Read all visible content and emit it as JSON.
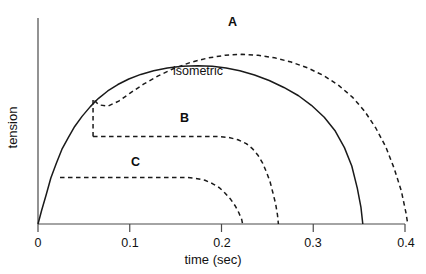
{
  "chart_data": {
    "type": "line",
    "title": "",
    "xlabel": "time (sec)",
    "ylabel": "tension",
    "xlim": [
      0,
      0.4
    ],
    "ylim": [
      0,
      1
    ],
    "xticks": [
      0,
      0.1,
      0.2,
      0.3,
      0.4
    ],
    "xticklabels": [
      "0",
      "0.1",
      "0.2",
      "0.3",
      "0.4"
    ],
    "yticks": [],
    "yticklabels": [],
    "grid": false,
    "legend": "inline-annotations",
    "annotations": [
      {
        "text": "A",
        "x": 0.215,
        "y": 0.93,
        "style": "bold"
      },
      {
        "text": "isometric",
        "x": 0.172,
        "y": 0.735,
        "style": "plain"
      },
      {
        "text": "B",
        "x": 0.159,
        "y": 0.535,
        "style": "bold"
      },
      {
        "text": "C",
        "x": 0.102,
        "y": 0.315,
        "style": "bold"
      }
    ],
    "series": [
      {
        "name": "isometric",
        "style": "solid",
        "points": [
          [
            0.0,
            0.0
          ],
          [
            0.004,
            0.075
          ],
          [
            0.009,
            0.16
          ],
          [
            0.014,
            0.25
          ],
          [
            0.02,
            0.33
          ],
          [
            0.026,
            0.405
          ],
          [
            0.033,
            0.47
          ],
          [
            0.04,
            0.53
          ],
          [
            0.048,
            0.585
          ],
          [
            0.057,
            0.638
          ],
          [
            0.066,
            0.683
          ],
          [
            0.076,
            0.723
          ],
          [
            0.087,
            0.758
          ],
          [
            0.099,
            0.788
          ],
          [
            0.112,
            0.813
          ],
          [
            0.126,
            0.833
          ],
          [
            0.141,
            0.848
          ],
          [
            0.157,
            0.857
          ],
          [
            0.174,
            0.86
          ],
          [
            0.19,
            0.857
          ],
          [
            0.205,
            0.848
          ],
          [
            0.22,
            0.833
          ],
          [
            0.236,
            0.81
          ],
          [
            0.252,
            0.78
          ],
          [
            0.268,
            0.742
          ],
          [
            0.284,
            0.697
          ],
          [
            0.298,
            0.645
          ],
          [
            0.312,
            0.58
          ],
          [
            0.324,
            0.505
          ],
          [
            0.334,
            0.415
          ],
          [
            0.342,
            0.315
          ],
          [
            0.348,
            0.195
          ],
          [
            0.352,
            0.09
          ],
          [
            0.354,
            0.0
          ]
        ]
      },
      {
        "name": "A",
        "style": "dashed",
        "points": [
          [
            0.06,
            0.475
          ],
          [
            0.06,
            0.68
          ],
          [
            0.066,
            0.648
          ],
          [
            0.076,
            0.64
          ],
          [
            0.088,
            0.668
          ],
          [
            0.1,
            0.71
          ],
          [
            0.115,
            0.76
          ],
          [
            0.131,
            0.805
          ],
          [
            0.148,
            0.845
          ],
          [
            0.166,
            0.878
          ],
          [
            0.185,
            0.902
          ],
          [
            0.204,
            0.917
          ],
          [
            0.222,
            0.922
          ],
          [
            0.24,
            0.917
          ],
          [
            0.258,
            0.903
          ],
          [
            0.276,
            0.88
          ],
          [
            0.294,
            0.848
          ],
          [
            0.312,
            0.805
          ],
          [
            0.328,
            0.752
          ],
          [
            0.343,
            0.688
          ],
          [
            0.356,
            0.613
          ],
          [
            0.368,
            0.523
          ],
          [
            0.379,
            0.42
          ],
          [
            0.388,
            0.305
          ],
          [
            0.396,
            0.18
          ],
          [
            0.401,
            0.062
          ],
          [
            0.403,
            0.0
          ]
        ]
      },
      {
        "name": "B",
        "style": "dashed",
        "points": [
          [
            0.06,
            0.475
          ],
          [
            0.08,
            0.475
          ],
          [
            0.11,
            0.475
          ],
          [
            0.14,
            0.475
          ],
          [
            0.17,
            0.475
          ],
          [
            0.196,
            0.475
          ],
          [
            0.208,
            0.47
          ],
          [
            0.218,
            0.458
          ],
          [
            0.227,
            0.437
          ],
          [
            0.234,
            0.408
          ],
          [
            0.24,
            0.372
          ],
          [
            0.245,
            0.33
          ],
          [
            0.249,
            0.282
          ],
          [
            0.253,
            0.228
          ],
          [
            0.256,
            0.17
          ],
          [
            0.259,
            0.11
          ],
          [
            0.261,
            0.05
          ],
          [
            0.262,
            0.0
          ]
        ]
      },
      {
        "name": "C",
        "style": "dashed",
        "points": [
          [
            0.024,
            0.253
          ],
          [
            0.05,
            0.253
          ],
          [
            0.08,
            0.253
          ],
          [
            0.11,
            0.253
          ],
          [
            0.14,
            0.253
          ],
          [
            0.162,
            0.253
          ],
          [
            0.172,
            0.248
          ],
          [
            0.182,
            0.238
          ],
          [
            0.19,
            0.22
          ],
          [
            0.198,
            0.196
          ],
          [
            0.204,
            0.167
          ],
          [
            0.21,
            0.134
          ],
          [
            0.215,
            0.098
          ],
          [
            0.219,
            0.06
          ],
          [
            0.222,
            0.025
          ],
          [
            0.223,
            0.0
          ]
        ]
      }
    ]
  },
  "axes": {
    "x_title": "time (sec)",
    "y_title": "tension",
    "tick_0": "0",
    "tick_1": "0.1",
    "tick_2": "0.2",
    "tick_3": "0.3",
    "tick_4": "0.4"
  },
  "labels": {
    "curve_a": "A",
    "curve_b": "B",
    "curve_c": "C",
    "isometric": "isometric"
  },
  "colors": {
    "axis": "#444444",
    "curve": "#1a1a1a",
    "text": "#111111",
    "background": "#ffffff"
  }
}
